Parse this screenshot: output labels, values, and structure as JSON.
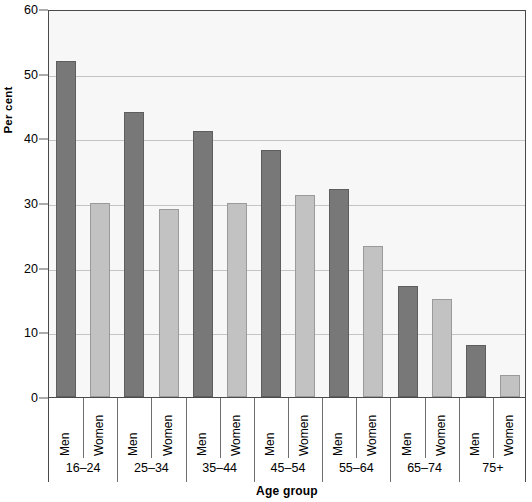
{
  "chart_data": {
    "type": "bar",
    "title": "",
    "xlabel": "Age group",
    "ylabel": "Per cent",
    "categories": [
      "16–24",
      "25–34",
      "35–44",
      "45–54",
      "55–64",
      "65–74",
      "75+"
    ],
    "series": [
      {
        "name": "Men",
        "values": [
          52,
          44,
          41.2,
          38.2,
          32.1,
          17.2,
          8.1
        ]
      },
      {
        "name": "Women",
        "values": [
          30,
          29,
          30,
          31.2,
          23.3,
          15.1,
          3.4
        ]
      }
    ],
    "ylim": [
      0,
      60
    ],
    "yticks": [
      0,
      10,
      20,
      30,
      40,
      50,
      60
    ],
    "ytick_labels": [
      "0",
      "10",
      "20",
      "30",
      "40",
      "50",
      "60"
    ],
    "grid": true,
    "legend_position": "none",
    "colors": {
      "men": "#787878",
      "men_border": "#5e5e5e",
      "women": "#c2c2c2",
      "women_border": "#9a9a9a",
      "plot_background": "#f7f7f7",
      "gridline": "#c4c4c4",
      "axis": "#4a4a4a",
      "text": "#000000"
    }
  }
}
